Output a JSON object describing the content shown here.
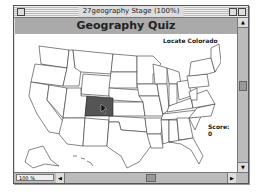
{
  "window": {
    "title": "27geography Stage (100%)"
  },
  "stage": {
    "header": "Geography Quiz",
    "prompt": "Locate Colorado",
    "score_label": "Score:",
    "score_value": "0",
    "highlighted_state": "Colorado",
    "highlight_color": "#555555"
  },
  "statusbar": {
    "zoom_level": "100 %"
  },
  "icons": {
    "up": "▲",
    "down": "▼",
    "left": "◀",
    "right": "▶"
  }
}
